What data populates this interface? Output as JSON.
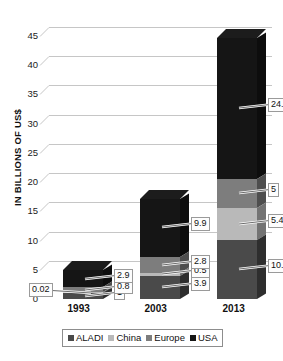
{
  "chart_data": {
    "type": "bar",
    "subtype": "stacked-column-3d",
    "title": "",
    "xlabel": "",
    "ylabel": "IN BILLIONS OF US$",
    "categories": [
      "1993",
      "2003",
      "2013"
    ],
    "ylim": [
      0,
      45
    ],
    "yticks": [
      0,
      5,
      10,
      15,
      20,
      25,
      30,
      35,
      40,
      45
    ],
    "ytick_labels": [
      "0",
      "5",
      "10",
      "15",
      "20",
      "25",
      "30",
      "35",
      "40",
      "45"
    ],
    "grid": true,
    "legend_position": "bottom",
    "stack_order_bottom_to_top": [
      "ALADI",
      "China",
      "Europe",
      "USA"
    ],
    "series": [
      {
        "name": "ALADI",
        "color": "#4a4a4a",
        "values": [
          1,
          3.9,
          10.1
        ],
        "labels": [
          "1",
          "3.9",
          "10.1"
        ]
      },
      {
        "name": "China",
        "color": "#b9b9b9",
        "values": [
          0.02,
          0.5,
          5.4
        ],
        "labels": [
          "0.02",
          "0.5",
          "5.4"
        ]
      },
      {
        "name": "Europe",
        "color": "#7d7d7d",
        "values": [
          0.8,
          2.8,
          5
        ],
        "labels": [
          "0.8",
          "2.8",
          "5"
        ]
      },
      {
        "name": "USA",
        "color": "#151515",
        "values": [
          2.9,
          9.9,
          24.1
        ],
        "labels": [
          "2.9",
          "9.9",
          "24.1"
        ]
      }
    ],
    "totals": [
      4.72,
      17.1,
      44.6
    ]
  },
  "legend": {
    "items": [
      {
        "label": "ALADI",
        "color": "#4a4a4a"
      },
      {
        "label": "China",
        "color": "#b9b9b9"
      },
      {
        "label": "Europe",
        "color": "#7d7d7d"
      },
      {
        "label": "USA",
        "color": "#151515"
      }
    ]
  }
}
